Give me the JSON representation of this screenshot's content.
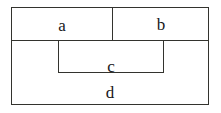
{
  "figure": {
    "type": "nested-rectangle-diagram",
    "width": 221,
    "height": 113,
    "background_color": "#ffffff",
    "line_color": "#33332e",
    "text_color": "#17171a"
  },
  "regions": [
    {
      "id": "a",
      "label": "a",
      "role": "top-left-cell",
      "x": 11,
      "y": 7,
      "width": 101,
      "height": 33
    },
    {
      "id": "b",
      "label": "b",
      "role": "top-right-cell",
      "x": 112,
      "y": 7,
      "width": 97,
      "height": 33
    },
    {
      "id": "c",
      "label": "c",
      "role": "inner-rectangle",
      "x": 58,
      "y": 40,
      "width": 106,
      "height": 33
    },
    {
      "id": "d",
      "label": "d",
      "role": "outer-rectangle",
      "x": 11,
      "y": 7,
      "width": 198,
      "height": 98
    }
  ],
  "labels": {
    "a": "a",
    "b": "b",
    "c": "c",
    "d": "d"
  }
}
